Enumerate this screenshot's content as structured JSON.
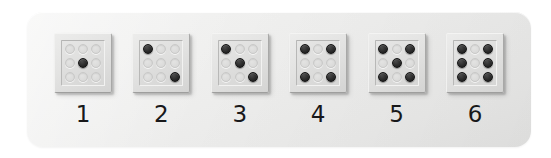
{
  "scene": {
    "description": "Row of six raised dice-face tiles on a light grey rounded panel, each labelled with a numeral from 1 to 6",
    "background_color": "#ffffff",
    "panel_color": "#eeeeed",
    "pip_on_color": "#1f1f1f",
    "pip_off_color": "#dcdcdb",
    "label_color": "#18181a"
  },
  "dice": [
    {
      "label": "1",
      "count": 1,
      "name": "die-one",
      "pips": [
        0,
        0,
        0,
        0,
        1,
        0,
        0,
        0,
        0
      ]
    },
    {
      "label": "2",
      "count": 2,
      "name": "die-two",
      "pips": [
        1,
        0,
        0,
        0,
        0,
        0,
        0,
        0,
        1
      ]
    },
    {
      "label": "3",
      "count": 3,
      "name": "die-three",
      "pips": [
        1,
        0,
        0,
        0,
        1,
        0,
        0,
        0,
        1
      ]
    },
    {
      "label": "4",
      "count": 4,
      "name": "die-four",
      "pips": [
        1,
        0,
        1,
        0,
        0,
        0,
        1,
        0,
        1
      ]
    },
    {
      "label": "5",
      "count": 5,
      "name": "die-five",
      "pips": [
        1,
        0,
        1,
        0,
        1,
        0,
        1,
        0,
        1
      ]
    },
    {
      "label": "6",
      "count": 6,
      "name": "die-six",
      "pips": [
        1,
        0,
        1,
        1,
        0,
        1,
        1,
        0,
        1
      ]
    }
  ]
}
